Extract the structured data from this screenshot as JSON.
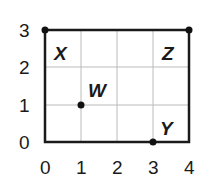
{
  "diagram": {
    "type": "coordinate-grid",
    "x_ticks": [
      "0",
      "1",
      "2",
      "3",
      "4"
    ],
    "y_ticks": [
      "0",
      "1",
      "2",
      "3"
    ],
    "xlim": [
      0,
      4
    ],
    "ylim": [
      0,
      3
    ],
    "points": [
      {
        "label": "X",
        "x": 0,
        "y": 3
      },
      {
        "label": "Z",
        "x": 4,
        "y": 3
      },
      {
        "label": "W",
        "x": 1,
        "y": 1
      },
      {
        "label": "Y",
        "x": 3,
        "y": 0
      }
    ],
    "rectangle": {
      "corners": [
        [
          0,
          0
        ],
        [
          4,
          0
        ],
        [
          4,
          3
        ],
        [
          0,
          3
        ]
      ]
    },
    "colors": {
      "grid": "#bbbbbb",
      "border": "#1a1a1a",
      "point": "#111111"
    }
  }
}
